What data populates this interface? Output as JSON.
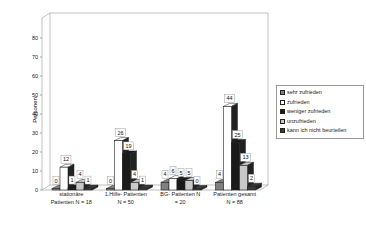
{
  "chart_data": {
    "type": "bar",
    "title": "",
    "xlabel": "",
    "ylabel": "Personen",
    "ylim": [
      0,
      85
    ],
    "yticks": [
      0,
      10,
      20,
      30,
      40,
      50,
      60,
      70,
      80
    ],
    "grid": false,
    "three_d": true,
    "legend_position": "right",
    "categories": [
      "stationäre Patienten N = 18",
      "1.Hilfe- Patienten N = 50",
      "BG- Patienten N = 20",
      "Patienten gesamt N = 88"
    ],
    "category_lines": [
      [
        "stationäre",
        "Patienten N = 18"
      ],
      [
        "1.Hilfe- Patienten",
        "N = 50"
      ],
      [
        "BG- Patienten   N",
        "= 20"
      ],
      [
        "Patienten gesamt",
        "N = 88"
      ]
    ],
    "series": [
      {
        "name": "sehr zufrieden",
        "color": "#808080",
        "values": [
          0,
          0,
          4,
          4
        ]
      },
      {
        "name": "zufrieden",
        "color": "#ffffff",
        "values": [
          12,
          26,
          6,
          44
        ]
      },
      {
        "name": "weniger zufrieden",
        "color": "#1a1a1a",
        "values": [
          1,
          19,
          5,
          25
        ]
      },
      {
        "name": "unzufrieden",
        "color": "#c8c8c8",
        "values": [
          4,
          4,
          5,
          13
        ]
      },
      {
        "name": "kann ich nicht beurteilen",
        "color": "#3a3a3a",
        "values": [
          1,
          1,
          0,
          2
        ]
      }
    ]
  }
}
